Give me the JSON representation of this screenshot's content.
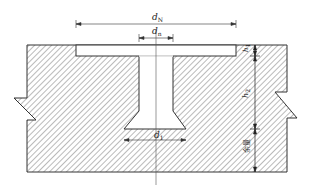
{
  "diagram": {
    "type": "cross-section drawing",
    "colors": {
      "line": "#333333",
      "hatch": "#555555",
      "background": "#ffffff"
    },
    "dimensions": {
      "top_width": {
        "symbol": "d",
        "subscript": "N"
      },
      "neck_width": {
        "symbol": "d",
        "subscript": "n"
      },
      "bottom_width": {
        "symbol": "d",
        "subscript": "1"
      }
    },
    "vertical_dimensions": {
      "top": {
        "symbol": "h",
        "subscript": "1"
      },
      "middle": {
        "symbol": "h",
        "subscript": "2"
      },
      "bottom": {
        "text": "余量"
      }
    }
  }
}
